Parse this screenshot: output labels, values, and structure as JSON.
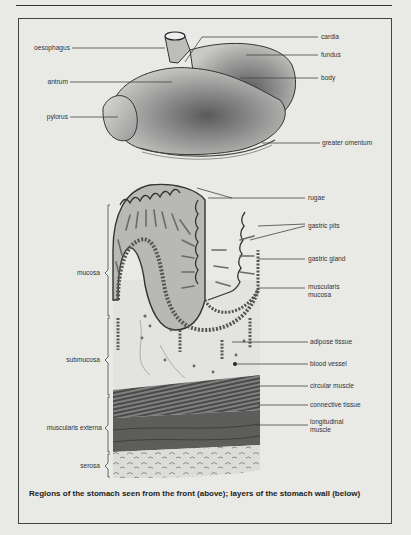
{
  "header": {
    "text": ""
  },
  "stomach_regions": {
    "left_labels": [
      {
        "id": "oesophagus",
        "text": "oesophagus"
      },
      {
        "id": "antrum",
        "text": "antrum"
      },
      {
        "id": "pylorus",
        "text": "pylorus"
      }
    ],
    "right_labels": [
      {
        "id": "cardia",
        "text": "cardia"
      },
      {
        "id": "fundus",
        "text": "fundus"
      },
      {
        "id": "body",
        "text": "body"
      },
      {
        "id": "greater-omentum",
        "text": "greater omentum"
      }
    ]
  },
  "wall_layers": {
    "left_labels": [
      {
        "id": "mucosa",
        "text": "mucosa"
      },
      {
        "id": "submucosa",
        "text": "submucosa"
      },
      {
        "id": "muscularis-externa",
        "text": "muscularis externa"
      },
      {
        "id": "serosa",
        "text": "serosa"
      }
    ],
    "right_labels": [
      {
        "id": "rugae",
        "text": "rugae"
      },
      {
        "id": "gastric-pits",
        "text": "gastric pits"
      },
      {
        "id": "gastric-gland",
        "text": "gastric gland"
      },
      {
        "id": "muscularis-mucosa",
        "text": "muscularis\nmucosa"
      },
      {
        "id": "adipose-tissue",
        "text": "adipose tissue"
      },
      {
        "id": "blood-vessel",
        "text": "blood vessel"
      },
      {
        "id": "circular-muscle",
        "text": "circular muscle"
      },
      {
        "id": "connective-tissue",
        "text": "connective tissue"
      },
      {
        "id": "longitudinal-muscle",
        "text": "longitudinal\nmuscle"
      }
    ]
  },
  "caption": "Regions of the stomach seen from the front (above); layers of the stomach wall (below)",
  "colors": {
    "background": "#e9e9e6",
    "ink": "#333333",
    "tissue_dark": "#555555",
    "tissue_mid": "#8a8a8a"
  }
}
